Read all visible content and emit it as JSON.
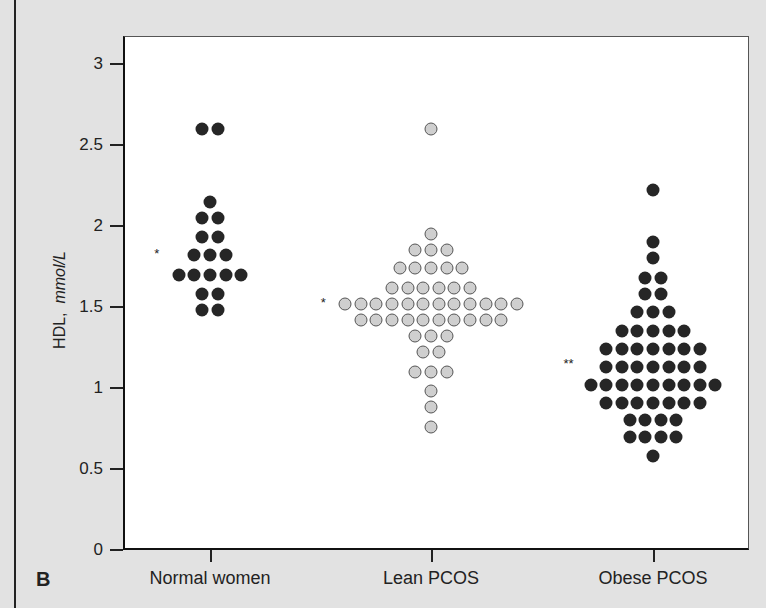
{
  "chart_data": {
    "type": "scatter",
    "subtype": "dot-plot",
    "panel_label": "B",
    "title": "",
    "xlabel": "",
    "ylabel": "HDL, mmol/L",
    "ylabel_parts": {
      "plain": "HDL,",
      "italic": "mmol/L"
    },
    "ylim": [
      0,
      3
    ],
    "yticks": [
      "0",
      "0.5",
      "1",
      "1.5",
      "2",
      "2.5",
      "3"
    ],
    "categories": [
      "Normal women",
      "Lean PCOS",
      "Obese PCOS"
    ],
    "grid": false,
    "legend": null,
    "series": [
      {
        "name": "Normal women",
        "marker": "dark",
        "annotation": "*",
        "annotation_y": 1.85,
        "rows": [
          {
            "value": 2.6,
            "count": 2
          },
          {
            "value": 2.15,
            "count": 1
          },
          {
            "value": 2.05,
            "count": 2
          },
          {
            "value": 1.93,
            "count": 2
          },
          {
            "value": 1.82,
            "count": 3
          },
          {
            "value": 1.7,
            "count": 5
          },
          {
            "value": 1.58,
            "count": 2
          },
          {
            "value": 1.48,
            "count": 2
          }
        ]
      },
      {
        "name": "Lean PCOS",
        "marker": "light",
        "annotation": "*",
        "annotation_y": 1.55,
        "rows": [
          {
            "value": 2.6,
            "count": 1
          },
          {
            "value": 1.95,
            "count": 1
          },
          {
            "value": 1.85,
            "count": 3
          },
          {
            "value": 1.74,
            "count": 5
          },
          {
            "value": 1.62,
            "count": 6
          },
          {
            "value": 1.52,
            "count": 12
          },
          {
            "value": 1.42,
            "count": 10
          },
          {
            "value": 1.32,
            "count": 3
          },
          {
            "value": 1.22,
            "count": 2
          },
          {
            "value": 1.1,
            "count": 3
          },
          {
            "value": 0.98,
            "count": 1
          },
          {
            "value": 0.88,
            "count": 1
          },
          {
            "value": 0.76,
            "count": 1
          }
        ]
      },
      {
        "name": "Obese PCOS",
        "marker": "dark",
        "annotation": "**",
        "annotation_y": 1.17,
        "rows": [
          {
            "value": 2.22,
            "count": 1
          },
          {
            "value": 1.9,
            "count": 1
          },
          {
            "value": 1.8,
            "count": 1
          },
          {
            "value": 1.68,
            "count": 2
          },
          {
            "value": 1.58,
            "count": 2
          },
          {
            "value": 1.47,
            "count": 3
          },
          {
            "value": 1.35,
            "count": 5
          },
          {
            "value": 1.24,
            "count": 7
          },
          {
            "value": 1.13,
            "count": 7
          },
          {
            "value": 1.02,
            "count": 9
          },
          {
            "value": 0.91,
            "count": 7
          },
          {
            "value": 0.8,
            "count": 4
          },
          {
            "value": 0.7,
            "count": 4
          },
          {
            "value": 0.58,
            "count": 1
          }
        ]
      }
    ]
  }
}
